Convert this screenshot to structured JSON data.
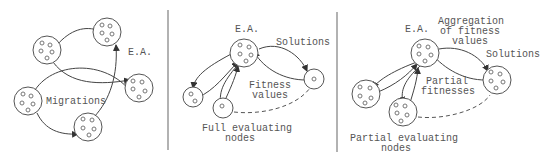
{
  "colors": {
    "background": "#ffffff",
    "stroke": "#555555",
    "text": "#555555",
    "divider": "#999999"
  },
  "panels": [
    {
      "name": "island-model",
      "labels": {
        "ea": "E.A.",
        "migrations": "Migrations"
      }
    },
    {
      "name": "master-slave-full",
      "labels": {
        "ea": "E.A.",
        "solutions": "Solutions",
        "fitness_line1": "Fitness",
        "fitness_line2": "values",
        "nodes_line1": "Full evaluating",
        "nodes_line2": "nodes"
      }
    },
    {
      "name": "master-slave-partial",
      "labels": {
        "ea": "E.A.",
        "aggregation_line1": "Aggregation",
        "aggregation_line2": "of fitness",
        "aggregation_line3": "values",
        "solutions": "Solutions",
        "partial_line1": "Partial",
        "partial_line2": "fitnesses",
        "nodes_line1": "Partial evaluating",
        "nodes_line2": "nodes"
      }
    }
  ]
}
